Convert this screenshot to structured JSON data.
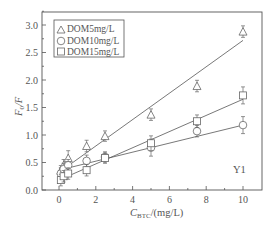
{
  "chart_data": {
    "type": "scatter",
    "title": "",
    "xlabel": "C_BTC/(mg/L)",
    "xlabel_main": "C",
    "xlabel_sub": "BTC",
    "xlabel_unit": "/(mg/L)",
    "ylabel": "F0/F",
    "ylabel_main": "F",
    "ylabel_sub": "0",
    "ylabel_tail": "/F",
    "xlim": [
      -0.8,
      11
    ],
    "ylim": [
      0.0,
      3.3
    ],
    "xticks": [
      0,
      2,
      4,
      6,
      8,
      10
    ],
    "xtick_labels": [
      "0",
      "2",
      "4",
      "6",
      "8",
      "10"
    ],
    "yticks": [
      0.0,
      0.5,
      1.0,
      1.5,
      2.0,
      2.5,
      3.0
    ],
    "ytick_labels": [
      "0.0",
      "0.5",
      "1.0",
      "1.5",
      "2.0",
      "2.5",
      "3.0"
    ],
    "grid": false,
    "legend_position": "upper left",
    "annotation": "Y1",
    "series": [
      {
        "name": "DOM5mg/L",
        "marker": "triangle",
        "x": [
          0.1,
          0.25,
          0.5,
          1.5,
          2.5,
          5,
          7.5,
          10
        ],
        "y": [
          0.35,
          0.45,
          0.58,
          0.8,
          0.98,
          1.37,
          1.89,
          2.88
        ],
        "err": [
          0.04,
          0.05,
          0.08,
          0.05,
          0.04,
          0.05,
          0.05,
          0.05
        ],
        "fit": {
          "x0": 0.0,
          "y0": 0.32,
          "x1": 10,
          "y1": 2.72
        }
      },
      {
        "name": "DOM10mg/L",
        "marker": "circle",
        "x": [
          0.1,
          0.25,
          0.5,
          1.5,
          2.5,
          5,
          7.5,
          10
        ],
        "y": [
          0.3,
          0.38,
          0.45,
          0.53,
          0.6,
          0.77,
          1.07,
          1.18
        ],
        "err": [
          0.05,
          0.05,
          0.05,
          0.05,
          0.04,
          0.1,
          0.05,
          0.1
        ],
        "fit": {
          "x0": 0.0,
          "y0": 0.36,
          "x1": 10,
          "y1": 1.18
        }
      },
      {
        "name": "DOM15mg/L",
        "marker": "square",
        "x": [
          0.1,
          0.25,
          0.5,
          1.5,
          2.5,
          5,
          7.5,
          10
        ],
        "y": [
          0.18,
          0.25,
          0.3,
          0.36,
          0.58,
          0.85,
          1.25,
          1.72
        ],
        "err": [
          0.05,
          0.05,
          0.05,
          0.05,
          0.04,
          0.08,
          0.06,
          0.1
        ],
        "fit": {
          "x0": 0.0,
          "y0": 0.18,
          "x1": 10,
          "y1": 1.65
        }
      }
    ]
  },
  "legend": {
    "items": [
      {
        "label": "DOM5mg/L",
        "marker": "triangle"
      },
      {
        "label": "DOM10mg/L",
        "marker": "circle"
      },
      {
        "label": "DOM15mg/L",
        "marker": "square"
      }
    ]
  },
  "colors": {
    "axis": "#555555",
    "marker": "#666666",
    "line": "#555555",
    "background": "#ffffff"
  }
}
